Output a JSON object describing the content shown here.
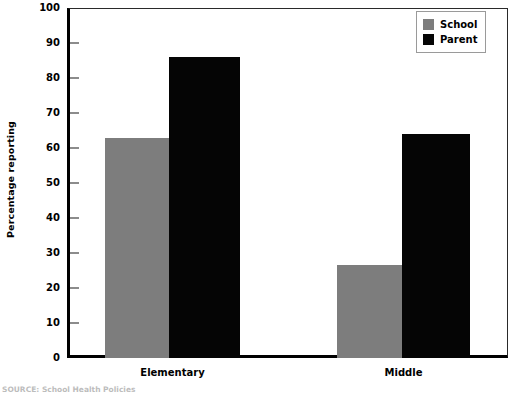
{
  "chart_data": {
    "type": "bar",
    "title": "",
    "xlabel": "",
    "ylabel": "Percentage reporting",
    "ylim": [
      0,
      100
    ],
    "yticks": [
      0,
      10,
      20,
      30,
      40,
      50,
      60,
      70,
      80,
      90,
      100
    ],
    "categories": [
      "Elementary",
      "Middle"
    ],
    "grid": false,
    "legend_position": "top-right",
    "series": [
      {
        "name": "School",
        "color": "#7d7d7d",
        "values": [
          63,
          26.5
        ]
      },
      {
        "name": "Parent",
        "color": "#050505",
        "values": [
          86,
          64
        ]
      }
    ]
  },
  "axis": {
    "y_title": "Percentage reporting",
    "y_tick_labels": [
      "100",
      "90",
      "80",
      "70",
      "60",
      "50",
      "40",
      "30",
      "20",
      "10",
      "0"
    ],
    "x_tick_labels": [
      "Elementary",
      "Middle"
    ]
  },
  "legend": {
    "entries": [
      {
        "label": "School",
        "color": "#7d7d7d"
      },
      {
        "label": "Parent",
        "color": "#050505"
      }
    ]
  },
  "footer": {
    "source_note": "SOURCE: School Health Policies"
  }
}
